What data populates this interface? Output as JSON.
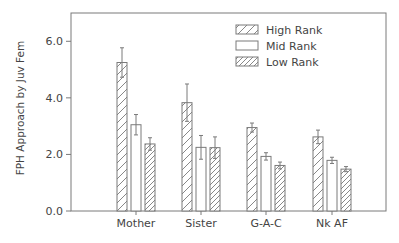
{
  "chart_data": {
    "type": "bar",
    "title": "",
    "xlabel": "",
    "ylabel": "FPH Approach by Juv Fem",
    "ylim": [
      0,
      7.0
    ],
    "yticks": [
      0.0,
      2.0,
      4.0,
      6.0
    ],
    "ytick_labels": [
      "0.0",
      "2.0",
      "4.0",
      "6.0"
    ],
    "categories": [
      "Mother",
      "Sister",
      "G-A-C",
      "Nk AF"
    ],
    "series": [
      {
        "name": "High Rank",
        "pattern": "sparse-hatch",
        "values": [
          5.25,
          3.83,
          2.95,
          2.62
        ],
        "error": [
          0.52,
          0.66,
          0.16,
          0.24
        ]
      },
      {
        "name": "Mid Rank",
        "pattern": "empty",
        "values": [
          3.05,
          2.25,
          1.93,
          1.79
        ],
        "error": [
          0.36,
          0.42,
          0.13,
          0.11
        ]
      },
      {
        "name": "Low Rank",
        "pattern": "dense-hatch",
        "values": [
          2.37,
          2.24,
          1.61,
          1.48
        ],
        "error": [
          0.22,
          0.38,
          0.12,
          0.09
        ]
      }
    ],
    "grid": false,
    "legend_position": "upper-right",
    "error_bars": true
  },
  "colors": {
    "stroke": "#7a7a7a",
    "text": "#444444",
    "background": "#ffffff"
  }
}
